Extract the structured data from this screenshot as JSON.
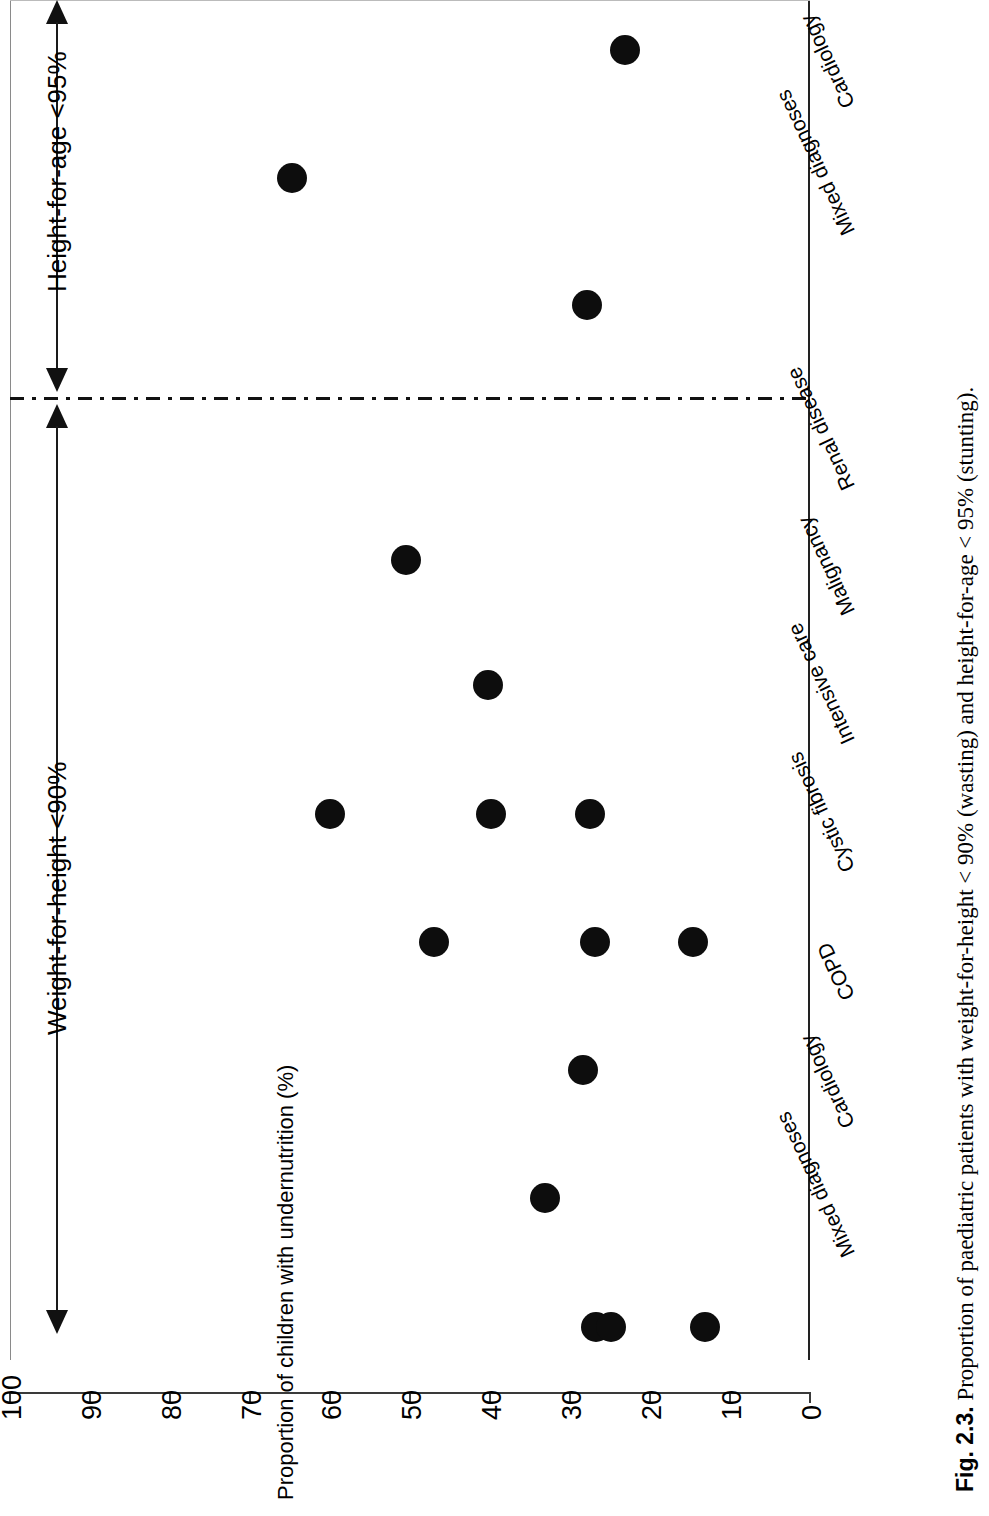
{
  "figure": {
    "number": "Fig. 2.3.",
    "caption": "Proportion of paediatric patients with weight-for-height < 90% (wasting) and height-for-age < 95% (stunting)."
  },
  "chart_data": {
    "type": "scatter",
    "title": "",
    "xlabel": "",
    "ylabel": "Proportion of children with undernutrition (%)",
    "ylim": [
      0,
      100
    ],
    "y_ticks": [
      100,
      90,
      80,
      70,
      60,
      50,
      40,
      30,
      20,
      10,
      0
    ],
    "y_axis_reversed": true,
    "orientation": "rotated-90",
    "grid": false,
    "legend": null,
    "groups": [
      {
        "name": "Weight-for-height <90%",
        "annotation": "wasting",
        "categories": [
          {
            "label": "Mixed diagnoses",
            "values": [
              26.8,
              24.9,
              13.1
            ]
          },
          {
            "label": "Cardiology",
            "values": [
              33.1
            ]
          },
          {
            "label": "COPD",
            "values": [
              28.4
            ]
          },
          {
            "label": "Cystic fibrosis",
            "values": [
              47.0,
              26.9,
              14.6
            ]
          },
          {
            "label": "Intensive care",
            "values": [
              60.0,
              39.9,
              27.5
            ]
          },
          {
            "label": "Malignancy",
            "values": [
              40.2
            ]
          },
          {
            "label": "Renal disease",
            "values": [
              50.5
            ]
          }
        ]
      },
      {
        "name": "Height-for-age <95%",
        "annotation": "stunting",
        "categories": [
          {
            "label": "Mixed diagnoses",
            "values": [
              27.9
            ]
          },
          {
            "label": "Cardiology",
            "values": [
              64.8
            ]
          },
          {
            "label": "Intensive care",
            "values": [
              23.1
            ]
          }
        ]
      }
    ]
  },
  "axis": {
    "tick_labels": [
      "100",
      "90",
      "80",
      "70",
      "60",
      "50",
      "40",
      "30",
      "20",
      "10",
      "0"
    ],
    "title": "Proportion of children with undernutrition (%)"
  },
  "brackets": {
    "wasting_label": "Weight-for-height <90%",
    "stunting_label": "Height-for-age <95%"
  },
  "category_labels": [
    "Mixed diagnoses",
    "Cardiology",
    "COPD",
    "Cystic fibrosis",
    "Intensive care",
    "Malignancy",
    "Renal disease",
    "Mixed diagnoses",
    "Cardiology",
    "Intensive care"
  ]
}
